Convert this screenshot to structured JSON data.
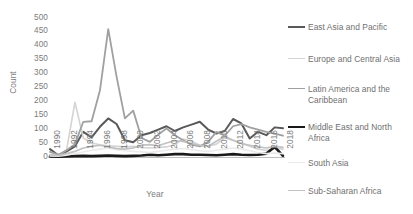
{
  "chart_data": {
    "type": "line",
    "title": "",
    "xlabel": "Year",
    "ylabel": "Count",
    "xlim": [
      1990,
      2018
    ],
    "ylim": [
      0,
      500
    ],
    "ytick_step": 50,
    "yticks": [
      500,
      450,
      400,
      350,
      300,
      250,
      200,
      150,
      100,
      50,
      0
    ],
    "xticks": [
      "1990",
      "1992",
      "1994",
      "1996",
      "1998",
      "2000",
      "2002",
      "2004",
      "2006",
      "2008",
      "2010",
      "2012",
      "2014",
      "2016",
      "2018"
    ],
    "x": [
      1990,
      1991,
      1992,
      1993,
      1994,
      1995,
      1996,
      1997,
      1998,
      1999,
      2000,
      2001,
      2002,
      2003,
      2004,
      2005,
      2006,
      2007,
      2008,
      2009,
      2010,
      2011,
      2012,
      2013,
      2014,
      2015,
      2016,
      2017,
      2018
    ],
    "grid": false,
    "legend_position": "right",
    "series": [
      {
        "name": "East Asia and Pacific",
        "color": "#595959",
        "width": 2.0,
        "values": [
          30,
          8,
          22,
          40,
          92,
          72,
          110,
          140,
          120,
          62,
          55,
          80,
          88,
          100,
          112,
          95,
          108,
          118,
          128,
          100,
          86,
          95,
          138,
          122,
          68,
          92,
          80,
          108,
          105
        ]
      },
      {
        "name": "Europe and Central Asia",
        "color": "#d4d4d4",
        "width": 1.6,
        "values": [
          8,
          6,
          28,
          198,
          70,
          52,
          46,
          42,
          40,
          38,
          40,
          36,
          34,
          36,
          38,
          46,
          66,
          58,
          44,
          40,
          48,
          70,
          62,
          52,
          40,
          30,
          26,
          32,
          30
        ]
      },
      {
        "name": "Latin America and the Caribbean",
        "color": "#a0a0a0",
        "width": 1.8,
        "values": [
          20,
          10,
          26,
          48,
          128,
          130,
          240,
          460,
          290,
          140,
          168,
          70,
          56,
          82,
          104,
          80,
          62,
          46,
          40,
          56,
          92,
          78,
          112,
          120,
          108,
          100,
          92,
          86,
          78
        ]
      },
      {
        "name": "Middle East and North Africa",
        "color": "#1a1a1a",
        "width": 2.6,
        "values": [
          4,
          3,
          4,
          5,
          6,
          5,
          6,
          7,
          6,
          5,
          6,
          7,
          10,
          8,
          10,
          12,
          12,
          10,
          10,
          9,
          8,
          10,
          12,
          10,
          9,
          10,
          14,
          38,
          6
        ]
      },
      {
        "name": "South Asia",
        "color": "#ebebeb",
        "width": 1.6,
        "values": [
          6,
          5,
          8,
          14,
          20,
          26,
          30,
          34,
          28,
          24,
          22,
          20,
          18,
          22,
          26,
          30,
          32,
          28,
          24,
          22,
          26,
          30,
          34,
          30,
          24,
          18,
          14,
          16,
          14
        ]
      },
      {
        "name": "Sub-Saharan Africa",
        "color": "#c2c2c2",
        "width": 1.7,
        "values": [
          10,
          7,
          14,
          22,
          34,
          40,
          44,
          38,
          32,
          30,
          34,
          44,
          46,
          42,
          52,
          60,
          58,
          50,
          44,
          40,
          58,
          76,
          62,
          50,
          44,
          38,
          34,
          40,
          36
        ]
      }
    ]
  },
  "legend": {
    "items": [
      {
        "label": "East Asia and Pacific"
      },
      {
        "label": "Europe and Central Asia"
      },
      {
        "label": "Latin America and the Caribbean"
      },
      {
        "label": "Middle East and North Africa"
      },
      {
        "label": "South Asia"
      },
      {
        "label": "Sub-Saharan Africa"
      }
    ]
  },
  "colors": {
    "axis_text": "#7b7b7b",
    "legend_text": "#6f6f6f",
    "background": "#ffffff"
  }
}
